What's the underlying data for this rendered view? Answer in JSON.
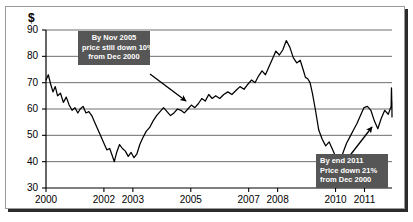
{
  "chart_data": {
    "type": "line",
    "title": "",
    "subtitle": "",
    "xlabel": "",
    "ylabel": "$",
    "ylim": [
      30,
      90
    ],
    "yticks": [
      30,
      40,
      50,
      60,
      70,
      80,
      90
    ],
    "ytick_labels": [
      "30",
      "40",
      "50",
      "60",
      "70",
      "80",
      "90"
    ],
    "xlim": [
      2000.0,
      2011.95
    ],
    "xticks": [
      2000,
      2002,
      2003,
      2005,
      2007,
      2008,
      2010,
      2011
    ],
    "xtick_labels": [
      "2000",
      "2002",
      "2003",
      "2005",
      "2007",
      "2008",
      "2010",
      "2011"
    ],
    "grid": "horizontal",
    "legend": "none",
    "series": [
      {
        "name": "price",
        "color": "#000000",
        "x": [
          2000.0,
          2000.08,
          2000.16,
          2000.24,
          2000.32,
          2000.4,
          2000.5,
          2000.6,
          2000.7,
          2000.8,
          2000.9,
          2001.0,
          2001.1,
          2001.18,
          2001.28,
          2001.38,
          2001.48,
          2001.58,
          2001.68,
          2001.78,
          2001.88,
          2002.0,
          2002.1,
          2002.2,
          2002.28,
          2002.36,
          2002.44,
          2002.54,
          2002.64,
          2002.74,
          2002.84,
          2002.94,
          2003.04,
          2003.14,
          2003.24,
          2003.34,
          2003.46,
          2003.58,
          2003.7,
          2003.82,
          2003.94,
          2004.06,
          2004.18,
          2004.3,
          2004.42,
          2004.54,
          2004.66,
          2004.78,
          2004.9,
          2005.02,
          2005.14,
          2005.26,
          2005.38,
          2005.5,
          2005.62,
          2005.74,
          2005.86,
          2006.0,
          2006.14,
          2006.28,
          2006.42,
          2006.56,
          2006.7,
          2006.84,
          2006.98,
          2007.1,
          2007.22,
          2007.34,
          2007.46,
          2007.58,
          2007.7,
          2007.82,
          2007.94,
          2008.06,
          2008.18,
          2008.3,
          2008.42,
          2008.54,
          2008.66,
          2008.78,
          2008.88,
          2008.96,
          2009.04,
          2009.12,
          2009.2,
          2009.3,
          2009.42,
          2009.54,
          2009.66,
          2009.78,
          2009.9,
          2010.02,
          2010.14,
          2010.26,
          2010.38,
          2010.5,
          2010.62,
          2010.74,
          2010.86,
          2010.98,
          2011.1,
          2011.22,
          2011.34,
          2011.46,
          2011.58,
          2011.7,
          2011.82,
          2011.92
        ],
        "y": [
          71.0,
          73.0,
          69.5,
          66.5,
          68.5,
          65.0,
          66.0,
          62.5,
          64.5,
          61.5,
          59.5,
          60.5,
          58.5,
          60.0,
          61.0,
          58.5,
          59.0,
          57.5,
          55.0,
          52.5,
          50.0,
          47.0,
          44.5,
          45.0,
          42.5,
          40.0,
          43.5,
          46.5,
          45.0,
          44.0,
          42.0,
          43.5,
          41.5,
          43.0,
          46.5,
          49.0,
          51.5,
          53.0,
          55.5,
          57.5,
          59.0,
          60.5,
          59.0,
          57.5,
          58.5,
          60.0,
          59.5,
          58.5,
          60.0,
          61.5,
          60.5,
          62.0,
          64.0,
          63.0,
          65.5,
          64.0,
          65.0,
          64.0,
          65.5,
          66.5,
          65.5,
          67.0,
          68.5,
          67.5,
          69.5,
          71.0,
          70.0,
          72.5,
          74.5,
          73.0,
          76.0,
          79.0,
          82.0,
          80.5,
          82.5,
          86.0,
          83.5,
          79.5,
          77.5,
          78.5,
          75.0,
          72.0,
          71.5,
          70.0,
          66.0,
          60.0,
          52.0,
          48.5,
          46.0,
          47.5,
          44.5,
          41.5,
          39.0,
          43.5,
          47.0,
          49.5,
          52.0,
          54.5,
          57.5,
          60.5,
          61.0,
          59.5,
          55.5,
          52.5,
          56.5,
          59.5,
          58.0,
          61.0
        ],
        "y_tail": [
          63.5,
          66.0,
          68.0,
          67.0,
          65.0,
          63.0,
          62.5,
          57.0
        ]
      }
    ],
    "annotations": [
      {
        "id": "callout-2005",
        "lines": [
          "By Nov 2005",
          "price still down 10%",
          "from Dec 2000"
        ],
        "box_color": "#565656",
        "text_color": "#ffffff",
        "arrow_from": [
          150,
          74
        ],
        "arrow_to": [
          186,
          101
        ]
      },
      {
        "id": "callout-2011",
        "lines": [
          "By end 2011",
          "Price down 21%",
          "from Dec 2000"
        ],
        "box_color": "#565656",
        "text_color": "#ffffff",
        "arrow_from": [
          348,
          158
        ],
        "arrow_to": [
          372,
          127
        ]
      }
    ]
  },
  "axis": {
    "currency_symbol": "$",
    "y_labels": [
      "90",
      "80",
      "70",
      "60",
      "50",
      "40",
      "30"
    ],
    "x_labels": [
      "2000",
      "2002",
      "2003",
      "2005",
      "2007",
      "2008",
      "2010",
      "2011"
    ]
  },
  "callout1": {
    "line1": "By Nov 2005",
    "line2": "price still down 10%",
    "line3": "from Dec 2000"
  },
  "callout2": {
    "line1": "By end 2011",
    "line2": "Price down 21%",
    "line3": "from Dec 2000"
  }
}
